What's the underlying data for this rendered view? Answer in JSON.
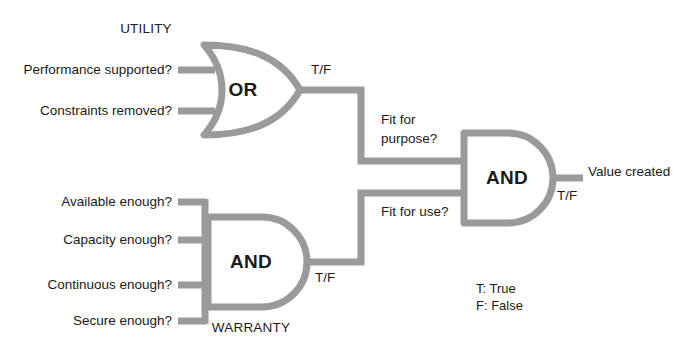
{
  "diagram": {
    "title_absent": "",
    "wire_color": "#9a9a9a",
    "text_color": "#1a1a1a",
    "background": "#ffffff",
    "groups": {
      "utility": "UTILITY",
      "warranty": "WARRANTY"
    },
    "gates": {
      "or_gate": {
        "type": "OR",
        "label": "OR",
        "group": "UTILITY",
        "output_signal": "T/F",
        "inputs": [
          "Performance supported?",
          "Constraints removed?"
        ]
      },
      "and_gate_warranty": {
        "type": "AND",
        "label": "AND",
        "group": "WARRANTY",
        "output_signal": "T/F",
        "inputs": [
          "Available enough?",
          "Capacity enough?",
          "Continuous enough?",
          "Secure enough?"
        ]
      },
      "and_gate_final": {
        "type": "AND",
        "label": "AND",
        "output_signal": "T/F",
        "inputs": [
          "Fit for purpose?",
          "Fit for use?"
        ],
        "output_label": "Value created"
      }
    },
    "intermediate_labels": {
      "fit_for_purpose_line1": "Fit for",
      "fit_for_purpose_line2": "purpose?",
      "fit_for_use": "Fit for use?"
    },
    "signals": {
      "or_output": "T/F",
      "warranty_output": "T/F",
      "final_output": "T/F"
    },
    "final_output_label": "Value created",
    "legend": [
      "T: True",
      "F: False"
    ]
  }
}
